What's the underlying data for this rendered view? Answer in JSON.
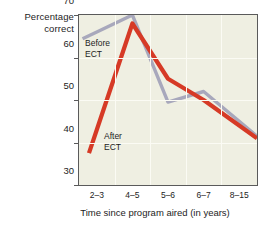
{
  "chart_data": {
    "type": "line",
    "title": "",
    "xlabel": "Time since program aired (in years)",
    "ylabel": "Percentage correct",
    "categories": [
      "2–3",
      "4–5",
      "5–6",
      "6–7",
      "8–15"
    ],
    "ylim": [
      30,
      70
    ],
    "yticks": [
      30,
      40,
      50,
      60,
      70
    ],
    "grid": true,
    "legend_position": "inline-annotations",
    "series": [
      {
        "name": "Before ECT",
        "color": "#a8a8bc",
        "values": [
          66,
          70,
          49.5,
          52,
          45
        ]
      },
      {
        "name": "After ECT",
        "color": "#d63a26",
        "values": [
          43,
          68,
          55,
          50,
          44
        ]
      }
    ],
    "annotations": [
      {
        "text": "Before\nECT",
        "series": "Before ECT"
      },
      {
        "text": "After\nECT",
        "series": "After ECT"
      }
    ],
    "plot_background": "#efefe2",
    "gridline_color": "#fbfbf4",
    "axis_color": "#5a5a5a"
  },
  "ylabel_line1": "Percentage",
  "ylabel_line2": "correct",
  "xlabel_text": "Time since program aired (in years)",
  "ytick_labels": [
    "70",
    "60",
    "50",
    "40",
    "30"
  ],
  "xtick_labels": [
    "2–3",
    "4–5",
    "5–6",
    "6–7",
    "8–15"
  ],
  "annotation_before": "Before\nECT",
  "annotation_after": "After\nECT"
}
